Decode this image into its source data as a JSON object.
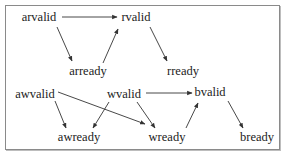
{
  "diagram": {
    "type": "signal-dependency-graph",
    "colors": {
      "text": "#222222",
      "edge": "#333333",
      "border": "#8a8a8a",
      "background": "#ffffff"
    },
    "nodes": [
      {
        "id": "arvalid",
        "label": "arvalid",
        "x": 39,
        "y": 21
      },
      {
        "id": "rvalid",
        "label": "rvalid",
        "x": 136,
        "y": 21
      },
      {
        "id": "arready",
        "label": "arready",
        "x": 88,
        "y": 75
      },
      {
        "id": "rready",
        "label": "rready",
        "x": 183,
        "y": 75
      },
      {
        "id": "awvalid",
        "label": "awvalid",
        "x": 35,
        "y": 98
      },
      {
        "id": "wvalid",
        "label": "wvalid",
        "x": 124,
        "y": 98
      },
      {
        "id": "bvalid",
        "label": "bvalid",
        "x": 210,
        "y": 96
      },
      {
        "id": "awready",
        "label": "awready",
        "x": 79,
        "y": 141
      },
      {
        "id": "wready",
        "label": "wready",
        "x": 167,
        "y": 141
      },
      {
        "id": "bready",
        "label": "bready",
        "x": 257,
        "y": 141
      }
    ],
    "edges": [
      {
        "from": "arvalid",
        "to": "rvalid",
        "x1": 62,
        "y1": 17,
        "x2": 117,
        "y2": 17
      },
      {
        "from": "arvalid",
        "to": "arready",
        "x1": 57,
        "y1": 27,
        "x2": 72,
        "y2": 61
      },
      {
        "from": "arready",
        "to": "rvalid",
        "x1": 103,
        "y1": 63,
        "x2": 118,
        "y2": 29
      },
      {
        "from": "rvalid",
        "to": "rready",
        "x1": 150,
        "y1": 27,
        "x2": 167,
        "y2": 61
      },
      {
        "from": "awvalid",
        "to": "awready",
        "x1": 55,
        "y1": 101,
        "x2": 66,
        "y2": 128
      },
      {
        "from": "awvalid",
        "to": "wready",
        "x1": 58,
        "y1": 92,
        "x2": 145,
        "y2": 124
      },
      {
        "from": "wvalid",
        "to": "awready",
        "x1": 109,
        "y1": 102,
        "x2": 93,
        "y2": 128
      },
      {
        "from": "wvalid",
        "to": "wready",
        "x1": 137,
        "y1": 102,
        "x2": 155,
        "y2": 128
      },
      {
        "from": "wvalid",
        "to": "bvalid",
        "x1": 146,
        "y1": 93,
        "x2": 192,
        "y2": 93
      },
      {
        "from": "wready",
        "to": "bvalid",
        "x1": 186,
        "y1": 128,
        "x2": 198,
        "y2": 103
      },
      {
        "from": "bvalid",
        "to": "bready",
        "x1": 228,
        "y1": 101,
        "x2": 243,
        "y2": 128
      }
    ]
  }
}
